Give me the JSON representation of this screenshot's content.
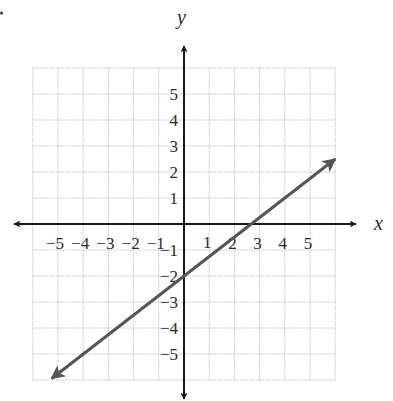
{
  "chart_data": {
    "type": "line",
    "title": "",
    "xlabel": "x",
    "ylabel": "y",
    "xlim": [
      -6,
      6
    ],
    "ylim": [
      -6,
      6
    ],
    "grid": true,
    "x_ticks": [
      "-5",
      "-4",
      "-3",
      "-2",
      "-1",
      "1",
      "2",
      "3",
      "4",
      "5"
    ],
    "y_ticks": [
      "5",
      "4",
      "3",
      "2",
      "1",
      "-1",
      "-2",
      "-3",
      "-4",
      "-5"
    ],
    "series": [
      {
        "name": "line",
        "equation": "y = (3/4)x - 2",
        "slope": 0.75,
        "y_intercept": -2,
        "x_intercept": 2.67,
        "x": [
          -5.25,
          0,
          2.67,
          6
        ],
        "y": [
          -5.94,
          -2,
          0,
          2.5
        ],
        "arrows": "both"
      }
    ]
  },
  "colors": {
    "grid": "#c8c8c8",
    "axis": "#1a1a1a",
    "line": "#555555",
    "text": "#2a2a2a"
  }
}
